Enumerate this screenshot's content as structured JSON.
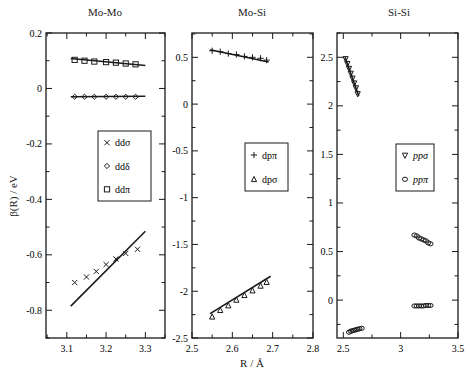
{
  "chart_data": [
    {
      "type": "scatter",
      "title": "Mo-Mo",
      "xlabel": "",
      "ylabel": "β(R) / eV",
      "xlim": [
        3.047,
        3.35
      ],
      "ylim": [
        -0.9,
        0.2
      ],
      "xticks": [
        3.1,
        3.2,
        3.3
      ],
      "xtick_labels": [
        "3.1",
        "3.2",
        "3.3"
      ],
      "yticks": [
        0.2,
        0,
        -0.2,
        -0.4,
        -0.6,
        -0.8
      ],
      "ytick_labels": [
        "0.2",
        "0",
        "-0.2",
        "-0.4",
        "-0.6",
        "-0.8"
      ],
      "legend": {
        "entries": [
          "ddσ",
          "ddδ",
          "ddπ"
        ],
        "markers": [
          "cross",
          "diamond",
          "square"
        ]
      },
      "series": [
        {
          "name": "ddσ",
          "marker": "cross",
          "x": [
            3.12,
            3.15,
            3.175,
            3.2,
            3.225,
            3.25,
            3.28
          ],
          "y": [
            -0.7,
            -0.68,
            -0.66,
            -0.635,
            -0.615,
            -0.595,
            -0.58
          ],
          "fit": {
            "x": [
              3.11,
              3.3
            ],
            "y": [
              -0.785,
              -0.515
            ]
          }
        },
        {
          "name": "ddδ",
          "marker": "diamond",
          "x": [
            3.12,
            3.145,
            3.17,
            3.2,
            3.225,
            3.25,
            3.275
          ],
          "y": [
            -0.03,
            -0.03,
            -0.03,
            -0.03,
            -0.03,
            -0.03,
            -0.03
          ],
          "fit": {
            "x": [
              3.11,
              3.3
            ],
            "y": [
              -0.03,
              -0.028
            ]
          }
        },
        {
          "name": "ddπ",
          "marker": "square",
          "x": [
            3.12,
            3.145,
            3.17,
            3.2,
            3.225,
            3.25,
            3.275
          ],
          "y": [
            0.103,
            0.1,
            0.097,
            0.095,
            0.093,
            0.09,
            0.087
          ],
          "fit": {
            "x": [
              3.11,
              3.3
            ],
            "y": [
              0.108,
              0.083
            ]
          }
        }
      ]
    },
    {
      "type": "scatter",
      "title": "Mo-Si",
      "xlabel": "R / Å",
      "ylabel": "",
      "xlim": [
        2.5,
        2.8
      ],
      "ylim": [
        -2.5,
        0.76
      ],
      "xticks": [
        2.5,
        2.6,
        2.7,
        2.8
      ],
      "xtick_labels": [
        "2.5",
        "2.6",
        "2.7",
        "2.8"
      ],
      "yticks": [
        0.5,
        0,
        -0.5,
        -1,
        -1.5,
        -2,
        -2.5
      ],
      "ytick_labels": [
        "0.5",
        "0",
        "-0.5",
        "-1",
        "-1.5",
        "-2",
        "-2.5"
      ],
      "legend": {
        "entries": [
          "dpπ",
          "dpσ"
        ],
        "markers": [
          "plus",
          "triangle-up"
        ]
      },
      "series": [
        {
          "name": "dpπ",
          "marker": "plus",
          "x": [
            2.55,
            2.57,
            2.59,
            2.61,
            2.63,
            2.65,
            2.67,
            2.685
          ],
          "y": [
            0.57,
            0.56,
            0.54,
            0.53,
            0.51,
            0.5,
            0.49,
            0.47
          ],
          "fit": {
            "x": [
              2.545,
              2.69
            ],
            "y": [
              0.58,
              0.45
            ]
          }
        },
        {
          "name": "dpσ",
          "marker": "triangle-up",
          "x": [
            2.55,
            2.57,
            2.59,
            2.61,
            2.63,
            2.65,
            2.67,
            2.685
          ],
          "y": [
            -2.27,
            -2.2,
            -2.15,
            -2.09,
            -2.04,
            -1.99,
            -1.94,
            -1.9
          ],
          "fit": {
            "x": [
              2.545,
              2.695
            ],
            "y": [
              -2.24,
              -1.84
            ]
          }
        }
      ]
    },
    {
      "type": "scatter",
      "title": "Si-Si",
      "xlabel": "",
      "ylabel": "",
      "xlim": [
        2.445,
        3.5
      ],
      "ylim": [
        -0.39,
        2.75
      ],
      "xticks": [
        2.5,
        3,
        3.5
      ],
      "xtick_labels": [
        "2.5",
        "3",
        "3.5"
      ],
      "yticks": [
        2.5,
        2,
        1.5,
        1,
        0.5,
        0
      ],
      "ytick_labels": [
        "2.5",
        "2",
        "1.5",
        "1",
        "0.5",
        "0"
      ],
      "legend": {
        "entries": [
          "ppσ",
          "ppπ"
        ],
        "markers": [
          "triangle-down",
          "circle"
        ]
      },
      "series": [
        {
          "name": "ppσ",
          "marker": "triangle-down",
          "x": [
            2.52,
            2.535,
            2.55,
            2.565,
            2.58,
            2.595,
            2.61,
            2.625
          ],
          "y": [
            2.48,
            2.43,
            2.38,
            2.33,
            2.28,
            2.23,
            2.18,
            2.12
          ],
          "fit": {
            "x": [
              2.515,
              2.635
            ],
            "y": [
              2.5,
              2.1
            ]
          }
        },
        {
          "name": "ppπ",
          "marker": "circle",
          "group": "lower-left",
          "x": [
            2.55,
            2.565,
            2.58,
            2.595,
            2.61,
            2.625,
            2.64,
            2.66
          ],
          "y": [
            -0.33,
            -0.32,
            -0.315,
            -0.31,
            -0.305,
            -0.3,
            -0.295,
            -0.29
          ]
        },
        {
          "name": "ppσ",
          "marker": "circle",
          "group": "upper-right",
          "x": [
            3.12,
            3.14,
            3.16,
            3.18,
            3.2,
            3.22,
            3.24,
            3.26
          ],
          "y": [
            0.67,
            0.66,
            0.64,
            0.63,
            0.62,
            0.61,
            0.59,
            0.58
          ]
        },
        {
          "name": "ppπ",
          "marker": "circle",
          "group": "lower-right",
          "x": [
            3.12,
            3.14,
            3.16,
            3.18,
            3.2,
            3.22,
            3.24,
            3.26
          ],
          "y": [
            -0.06,
            -0.06,
            -0.06,
            -0.06,
            -0.06,
            -0.055,
            -0.055,
            -0.055
          ]
        }
      ]
    }
  ],
  "figure": {
    "shared_ylabel": "β(R) / eV",
    "shared_xlabel": "R / Å"
  }
}
